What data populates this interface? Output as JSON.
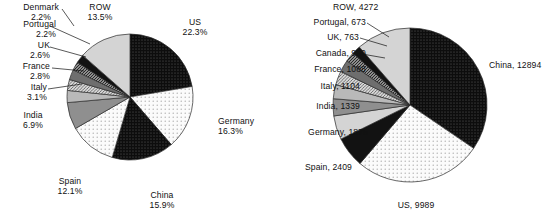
{
  "figure": {
    "background": "#ffffff",
    "text_color": "#111111",
    "outline_color": "#2a2a2a"
  },
  "chart_data": [
    {
      "id": "left-pie",
      "type": "pie",
      "title": "",
      "value_suffix": "%",
      "label_format": "name-newline-value",
      "start_angle_deg": 0,
      "direction": "clockwise",
      "center": [
        130,
        97
      ],
      "radius": 63,
      "categories": [
        "US",
        "Germany",
        "China",
        "Spain",
        "India",
        "Italy",
        "France",
        "UK",
        "Portugal",
        "Denmark",
        "ROW"
      ],
      "values": [
        22.3,
        16.3,
        15.9,
        12.1,
        6.9,
        3.1,
        2.8,
        2.6,
        2.2,
        2.2,
        13.5
      ],
      "labels": [
        "US\n22.3%",
        "Germany\n16.3%",
        "China\n15.9%",
        "Spain\n12.1%",
        "India\n6.9%",
        "Italy\n3.1%",
        "France\n2.8%",
        "UK\n2.6%",
        "Portugal\n2.2%",
        "Denmark\n2.2%",
        "ROW\n13.5%"
      ],
      "slice_fills": [
        "dots-dark",
        "dots-light",
        "dots-dark",
        "dots-light",
        "gray-mid",
        "gray-light",
        "hatch-mid",
        "gray-dark",
        "hatch-dark",
        "solid-dark",
        "gray-pale"
      ]
    },
    {
      "id": "right-pie",
      "type": "pie",
      "title": "",
      "value_suffix": "",
      "label_format": "name-comma-value",
      "start_angle_deg": 0,
      "direction": "clockwise",
      "center": [
        410,
        105
      ],
      "radius": 77,
      "categories": [
        "China",
        "US",
        "Spain",
        "Germany",
        "India",
        "Italy",
        "France",
        "Canada",
        "UK",
        "Portugal",
        "ROW"
      ],
      "values": [
        12894,
        9989,
        2409,
        1875,
        1339,
        1104,
        1088,
        950,
        763,
        673,
        4272
      ],
      "labels": [
        "China, 12894",
        "US, 9989",
        "Spain, 2409",
        "Germany, 1875",
        "India, 1339",
        "Italy, 1104",
        "France, 1088",
        "Canada, 950",
        "UK, 763",
        "Portugal, 673",
        "ROW, 4272"
      ],
      "slice_fills": [
        "dots-dark",
        "dots-light",
        "solid-dark",
        "gray-pale",
        "gray-mid",
        "gray-light",
        "hatch-mid",
        "gray-dark",
        "hatch-dark",
        "solid-dark",
        "gray-pale"
      ]
    }
  ],
  "left_labels": {
    "us": "US\n22.3%",
    "germany": "Germany\n16.3%",
    "china": "China\n15.9%",
    "spain": "Spain\n12.1%",
    "india": "India\n6.9%",
    "italy": "Italy\n3.1%",
    "france": "France\n2.8%",
    "uk": "UK\n2.6%",
    "portugal": "Portugal\n2.2%",
    "denmark": "Denmark\n2.2%",
    "row": "ROW\n13.5%"
  },
  "right_labels": {
    "china": "China, 12894",
    "us": "US, 9989",
    "spain": "Spain, 2409",
    "germany": "Germany, 1875",
    "india": "India, 1339",
    "italy": "Italy, 1104",
    "france": "France, 1088",
    "canada": "Canada, 950",
    "uk": "UK, 763",
    "portugal": "Portugal, 673",
    "row": "ROW, 4272"
  }
}
